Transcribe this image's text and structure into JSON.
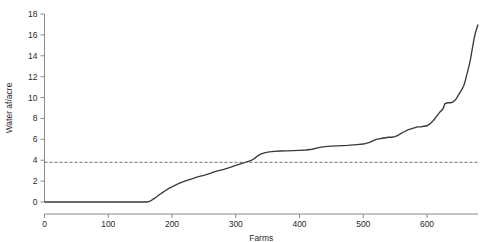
{
  "chart_data": {
    "type": "line",
    "title": "",
    "xlabel": "Farms",
    "ylabel": "Water af/acre",
    "xlim": [
      0,
      680
    ],
    "ylim": [
      0,
      18
    ],
    "xticks": [
      0,
      100,
      200,
      300,
      400,
      500,
      600
    ],
    "xtick_labels": [
      "0",
      "100",
      "200",
      "300",
      "400",
      "500",
      "600"
    ],
    "yticks": [
      0,
      2,
      4,
      6,
      8,
      10,
      12,
      14,
      16,
      18
    ],
    "ytick_labels": [
      "0",
      "2",
      "4",
      "6",
      "8",
      "10",
      "12",
      "14",
      "16",
      "18"
    ],
    "grid": false,
    "legend": null,
    "series": [
      {
        "name": "Water af/acre per farm (sorted)",
        "style": "solid",
        "color": "#3a3a3a",
        "x": [
          0,
          20,
          40,
          60,
          80,
          100,
          120,
          140,
          160,
          165,
          170,
          175,
          180,
          185,
          190,
          195,
          200,
          210,
          220,
          230,
          240,
          250,
          260,
          265,
          270,
          280,
          290,
          300,
          305,
          310,
          315,
          320,
          325,
          330,
          335,
          340,
          345,
          350,
          360,
          370,
          380,
          390,
          400,
          410,
          420,
          430,
          440,
          450,
          460,
          465,
          470,
          475,
          480,
          490,
          500,
          510,
          515,
          520,
          525,
          530,
          535,
          540,
          545,
          550,
          555,
          560,
          565,
          570,
          575,
          580,
          585,
          590,
          595,
          600,
          605,
          610,
          615,
          620,
          625,
          628,
          632,
          636,
          640,
          645,
          650,
          655,
          658,
          660,
          662,
          665,
          668,
          670,
          672,
          674,
          676,
          678,
          680
        ],
        "y": [
          0,
          0,
          0,
          0,
          0,
          0,
          0,
          0,
          0,
          0.05,
          0.25,
          0.45,
          0.7,
          0.9,
          1.1,
          1.3,
          1.45,
          1.75,
          2.0,
          2.2,
          2.4,
          2.55,
          2.75,
          2.85,
          2.95,
          3.1,
          3.3,
          3.5,
          3.6,
          3.7,
          3.8,
          3.9,
          4.0,
          4.2,
          4.45,
          4.6,
          4.7,
          4.78,
          4.85,
          4.88,
          4.9,
          4.92,
          4.95,
          4.98,
          5.05,
          5.2,
          5.3,
          5.35,
          5.38,
          5.4,
          5.4,
          5.42,
          5.45,
          5.5,
          5.55,
          5.7,
          5.85,
          6.0,
          6.05,
          6.1,
          6.15,
          6.2,
          6.2,
          6.25,
          6.4,
          6.6,
          6.75,
          6.9,
          7.0,
          7.1,
          7.2,
          7.2,
          7.25,
          7.3,
          7.5,
          7.8,
          8.2,
          8.6,
          8.9,
          9.4,
          9.5,
          9.5,
          9.55,
          9.8,
          10.3,
          10.8,
          11.2,
          11.6,
          12.1,
          12.8,
          13.6,
          14.3,
          15.0,
          15.7,
          16.2,
          16.6,
          17.0
        ]
      },
      {
        "name": "reference level",
        "style": "dashed",
        "color": "#6e6e6e",
        "constant_y": 3.8,
        "x": [
          0,
          680
        ],
        "y": [
          3.8,
          3.8
        ]
      }
    ],
    "annotations": []
  }
}
